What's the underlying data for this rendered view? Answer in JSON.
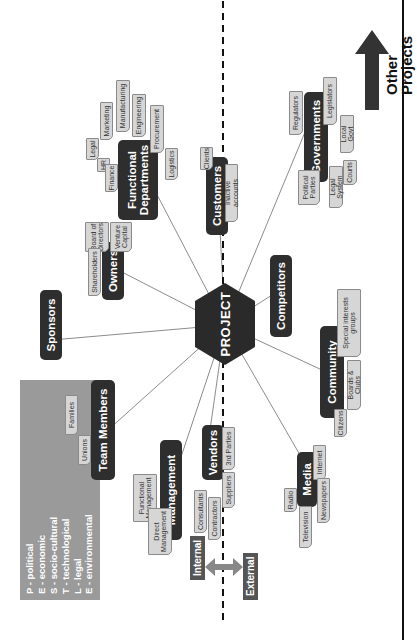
{
  "diagram": {
    "center": "PROJECT",
    "stakeholder_groups": [
      {
        "id": "functional_departments",
        "label": "Functional Departments",
        "items": [
          "Legal",
          "HR",
          "Finance",
          "Marketing",
          "Manufacturing",
          "Engineering",
          "Procurement",
          "Logistics"
        ]
      },
      {
        "id": "customers",
        "label": "Customers",
        "items": [
          "Clients",
          "Inactive accounts"
        ]
      },
      {
        "id": "governments",
        "label": "Governments",
        "items": [
          "Regulators",
          "Legislators",
          "Local Govt",
          "Political Parties",
          "Legal System",
          "Courts"
        ]
      },
      {
        "id": "competitors",
        "label": "Competitors",
        "items": []
      },
      {
        "id": "community",
        "label": "Community",
        "items": [
          "Special interests groups",
          "Boards & Clubs",
          "Citizens"
        ]
      },
      {
        "id": "media",
        "label": "Media",
        "items": [
          "Internet",
          "Newspapers",
          "Television",
          "Radio"
        ]
      },
      {
        "id": "vendors",
        "label": "Vendors",
        "items": [
          "3rd Parties",
          "Suppliers",
          "Contractors",
          "Consultants"
        ]
      },
      {
        "id": "management",
        "label": "Management",
        "items": [
          "Functional Management",
          "Direct Management"
        ]
      },
      {
        "id": "team_members",
        "label": "Team Members",
        "items": [
          "Families",
          "Unions"
        ]
      },
      {
        "id": "sponsors",
        "label": "Sponsors",
        "items": []
      },
      {
        "id": "owners",
        "label": "Owners",
        "items": [
          "Venture Capital",
          "Board of Directors",
          "Shareholders"
        ]
      }
    ],
    "pestle": [
      "P - political",
      "E - economic",
      "S - socio-cultural",
      "T - technological",
      "L - legal",
      "E - environmental"
    ],
    "boundary": {
      "internal": "Internal",
      "external": "External"
    },
    "other_projects": [
      "Other",
      "Projects"
    ],
    "colors": {
      "node": "#2e2e2e",
      "leaf": "#d6d6d6",
      "pestle": "#9a9a9a",
      "arrow": "#333333"
    }
  }
}
